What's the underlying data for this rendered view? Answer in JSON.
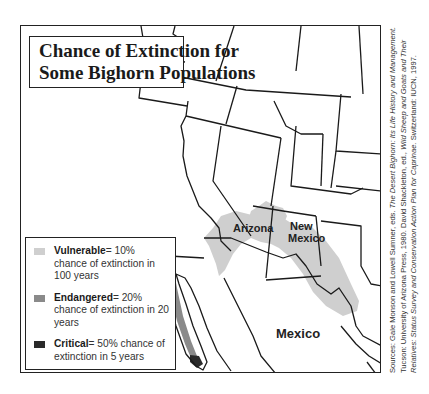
{
  "title": {
    "line1": "Chance of Extinction for",
    "line2": "Some Bighorn Populations"
  },
  "map_labels": {
    "arizona": "Arizona",
    "new_mexico_1": "New",
    "new_mexico_2": "Mexico",
    "baja": "Baja",
    "mexico": "Mexico"
  },
  "legend": {
    "items": [
      {
        "term": "Vulnerable",
        "desc": "= 10% chance of extinction in 100 years",
        "color": "#cfcfcf"
      },
      {
        "term": "Endangered",
        "desc": "= 20% chance of extinction in 20 years",
        "color": "#8a8a8a"
      },
      {
        "term": "Critical",
        "desc": "= 50% chance of extinction in 5 years",
        "color": "#2a2a2a"
      }
    ]
  },
  "sources": {
    "prefix": "Sources: Gale Monson and Lowell Sumner, eds. ",
    "book1": "The Desert Bighorn: Its Life History and Management.",
    "mid": " Tucson: University of Arizona Press, 1980. David Shackleton, ed., ",
    "book2": "Wild Sheep and Goats and Their Relatives: Status Survey and Conservation Action Plan for Caprinae.",
    "suffix": " Switzerland: IUCN, 1997."
  },
  "colors": {
    "vulnerable": "#cfcfcf",
    "endangered": "#8a8a8a",
    "critical": "#2a2a2a",
    "border": "#222222"
  }
}
